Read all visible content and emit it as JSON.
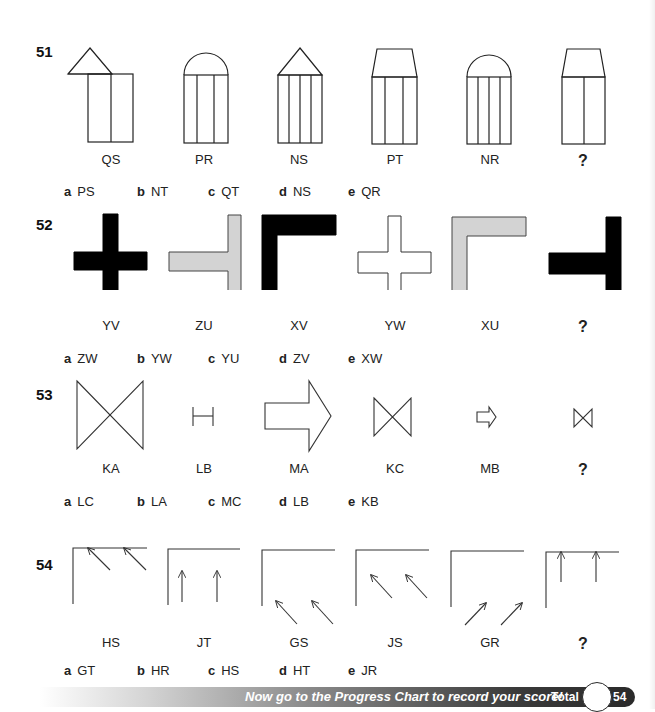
{
  "questions": [
    {
      "number": "51",
      "figures": [
        "QS",
        "PR",
        "NS",
        "PT",
        "NR",
        "?"
      ],
      "options": [
        {
          "letter": "a",
          "answer": "PS"
        },
        {
          "letter": "b",
          "answer": "NT"
        },
        {
          "letter": "c",
          "answer": "QT"
        },
        {
          "letter": "d",
          "answer": "NS"
        },
        {
          "letter": "e",
          "answer": "QR"
        }
      ]
    },
    {
      "number": "52",
      "figures": [
        "YV",
        "ZU",
        "XV",
        "YW",
        "XU",
        "?"
      ],
      "options": [
        {
          "letter": "a",
          "answer": "ZW"
        },
        {
          "letter": "b",
          "answer": "YW"
        },
        {
          "letter": "c",
          "answer": "YU"
        },
        {
          "letter": "d",
          "answer": "ZV"
        },
        {
          "letter": "e",
          "answer": "XW"
        }
      ]
    },
    {
      "number": "53",
      "figures": [
        "KA",
        "LB",
        "MA",
        "KC",
        "MB",
        "?"
      ],
      "options": [
        {
          "letter": "a",
          "answer": "LC"
        },
        {
          "letter": "b",
          "answer": "LA"
        },
        {
          "letter": "c",
          "answer": "MC"
        },
        {
          "letter": "d",
          "answer": "LB"
        },
        {
          "letter": "e",
          "answer": "KB"
        }
      ]
    },
    {
      "number": "54",
      "figures": [
        "HS",
        "JT",
        "GS",
        "JS",
        "GR",
        "?"
      ],
      "options": [
        {
          "letter": "a",
          "answer": "GT"
        },
        {
          "letter": "b",
          "answer": "HR"
        },
        {
          "letter": "c",
          "answer": "HS"
        },
        {
          "letter": "d",
          "answer": "HT"
        },
        {
          "letter": "e",
          "answer": "JR"
        }
      ]
    }
  ],
  "footer": {
    "message": "Now go to the Progress Chart to record your score!",
    "total_label": "Total",
    "total_max": "54"
  },
  "colors": {
    "black_fill": "#000000",
    "grey_fill": "#d3d3d3",
    "stroke": "#222222"
  }
}
